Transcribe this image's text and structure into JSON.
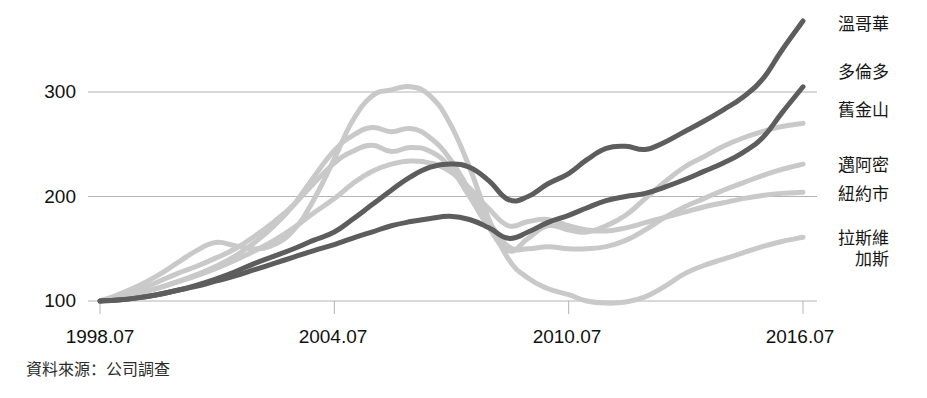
{
  "chart_data": {
    "type": "line",
    "title": "",
    "subtitle": "",
    "xlabel": "",
    "ylabel": "",
    "xlim": [
      1998.54,
      2016.54
    ],
    "ylim": [
      88,
      380
    ],
    "grid": true,
    "grid_axis": "y",
    "legend_position": "right-end-of-line",
    "y_ticks": [
      "100",
      "200",
      "300"
    ],
    "y_tick_values": [
      100,
      200,
      300
    ],
    "x_ticks": [
      "1998.07",
      "2004.07",
      "2010.07",
      "2016.07"
    ],
    "x_tick_values": [
      1998.54,
      2004.54,
      2010.54,
      2016.54
    ],
    "note": "Index, 1998.07 = 100",
    "x": [
      1998.54,
      1999.0,
      1999.5,
      2000.0,
      2000.5,
      2001.0,
      2001.5,
      2002.0,
      2002.5,
      2003.0,
      2003.5,
      2004.0,
      2004.54,
      2005.0,
      2005.5,
      2006.0,
      2006.5,
      2007.0,
      2007.5,
      2008.0,
      2008.5,
      2009.0,
      2009.5,
      2010.0,
      2010.54,
      2011.0,
      2011.5,
      2012.0,
      2012.5,
      2013.0,
      2013.5,
      2014.0,
      2014.5,
      2015.0,
      2015.5,
      2016.0,
      2016.54
    ],
    "series": [
      {
        "name": "溫哥華",
        "name_en": "Vancouver",
        "color": "#5d5d5d",
        "width": 5,
        "emphasis": "high",
        "values": [
          100,
          101,
          103,
          106,
          110,
          115,
          121,
          128,
          136,
          143,
          150,
          158,
          166,
          178,
          192,
          206,
          219,
          228,
          231,
          228,
          215,
          197,
          200,
          212,
          222,
          235,
          246,
          248,
          245,
          252,
          262,
          272,
          283,
          295,
          312,
          340,
          368
        ]
      },
      {
        "name": "多倫多",
        "name_en": "Toronto",
        "color": "#5d5d5d",
        "width": 5,
        "emphasis": "high",
        "values": [
          100,
          101,
          103,
          106,
          110,
          114,
          119,
          124,
          130,
          136,
          142,
          148,
          154,
          160,
          166,
          172,
          176,
          179,
          181,
          178,
          170,
          160,
          166,
          175,
          182,
          189,
          196,
          200,
          203,
          209,
          216,
          224,
          232,
          242,
          256,
          280,
          305
        ]
      },
      {
        "name": "舊金山",
        "name_en": "San Francisco",
        "color": "#c9c9c9",
        "width": 5,
        "emphasis": "low",
        "values": [
          100,
          104,
          110,
          118,
          126,
          133,
          141,
          150,
          162,
          176,
          192,
          212,
          232,
          243,
          249,
          243,
          247,
          243,
          228,
          200,
          170,
          148,
          160,
          172,
          168,
          166,
          172,
          182,
          198,
          214,
          228,
          238,
          248,
          256,
          262,
          267,
          270
        ]
      },
      {
        "name": "邁阿密",
        "name_en": "Miami",
        "color": "#c9c9c9",
        "width": 5,
        "emphasis": "low",
        "values": [
          100,
          103,
          107,
          112,
          118,
          125,
          133,
          143,
          156,
          172,
          192,
          218,
          244,
          258,
          266,
          262,
          265,
          256,
          236,
          206,
          176,
          152,
          150,
          152,
          150,
          150,
          152,
          158,
          168,
          180,
          190,
          198,
          206,
          213,
          220,
          226,
          231
        ]
      },
      {
        "name": "紐約市",
        "name_en": "New York City",
        "color": "#c9c9c9",
        "width": 5,
        "emphasis": "low",
        "values": [
          100,
          103,
          107,
          112,
          118,
          124,
          131,
          139,
          148,
          158,
          170,
          184,
          198,
          212,
          224,
          231,
          234,
          232,
          224,
          208,
          188,
          172,
          176,
          178,
          172,
          168,
          167,
          170,
          175,
          180,
          185,
          190,
          194,
          198,
          201,
          203,
          204
        ]
      },
      {
        "name": "拉斯維加斯",
        "name_label_line1": "拉斯維",
        "name_label_line2": "加斯",
        "name_en": "Las Vegas",
        "color": "#c9c9c9",
        "width": 5,
        "emphasis": "low",
        "values": [
          100,
          106,
          114,
          124,
          136,
          148,
          156,
          153,
          150,
          154,
          168,
          196,
          236,
          272,
          296,
          302,
          305,
          296,
          270,
          228,
          178,
          140,
          122,
          112,
          106,
          100,
          98,
          99,
          104,
          114,
          126,
          134,
          140,
          146,
          152,
          157,
          161
        ]
      }
    ]
  },
  "legend": [
    {
      "label": "溫哥華",
      "label2": ""
    },
    {
      "label": "多倫多",
      "label2": ""
    },
    {
      "label": "舊金山",
      "label2": ""
    },
    {
      "label": "邁阿密",
      "label2": ""
    },
    {
      "label": "紐約市",
      "label2": ""
    },
    {
      "label": "拉斯維",
      "label2": "加斯"
    }
  ],
  "axes": {
    "y_labels": [
      "300",
      "200",
      "100"
    ],
    "x_labels": [
      "1998.07",
      "2004.07",
      "2010.07",
      "2016.07"
    ]
  },
  "footer": {
    "source": "資料來源：公司調查"
  }
}
